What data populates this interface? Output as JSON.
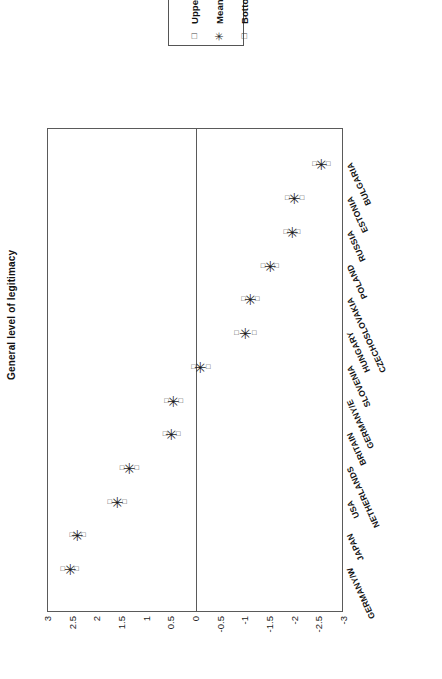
{
  "legend": {
    "title": "",
    "entries": [
      {
        "marker": "square-marker",
        "glyph": "□",
        "label": "Upper limit"
      },
      {
        "marker": "star-marker",
        "glyph": "✳",
        "label": "Mean"
      },
      {
        "marker": "square-marker",
        "glyph": "□",
        "label": "Bottom limit"
      }
    ]
  },
  "chart_data": {
    "type": "scatter",
    "title": "",
    "xlabel": "",
    "ylabel": "General level of legitimacy",
    "orientation": "horizontal",
    "grid": false,
    "legend_position": "top",
    "value_axis": {
      "label": "General level of legitimacy",
      "min": -3,
      "max": 3,
      "tick_step": 0.5,
      "ticks": [
        "3",
        "2.5",
        "2",
        "1.5",
        "1",
        "0.5",
        "0",
        "-0.5",
        "-1",
        "-1.5",
        "-2",
        "-2.5",
        "-3"
      ],
      "tick_values": [
        3,
        2.5,
        2,
        1.5,
        1,
        0.5,
        0,
        -0.5,
        -1,
        -1.5,
        -2,
        -2.5,
        -3
      ]
    },
    "categories": [
      "BULGARIA",
      "ESTONIA",
      "RUSSIA",
      "POLAND",
      "CZECHOSLOVAKIA",
      "HUNGARY",
      "SLOVENIA",
      "GERMANY/E",
      "BRITAIN",
      "NETHERLANDS",
      "USA",
      "JAPAN",
      "GERMANY/W"
    ],
    "series": [
      {
        "name": "Mean",
        "values": [
          -2.55,
          -2.0,
          -1.95,
          -1.5,
          -1.1,
          -1.0,
          -0.1,
          0.45,
          0.5,
          1.35,
          1.6,
          2.4,
          2.55
        ]
      },
      {
        "name": "Upper limit",
        "values": [
          -2.4,
          -1.85,
          -1.82,
          -1.36,
          -0.96,
          -0.82,
          0.05,
          0.6,
          0.63,
          1.5,
          1.75,
          2.52,
          2.7
        ]
      },
      {
        "name": "Bottom limit",
        "values": [
          -2.68,
          -2.15,
          -2.07,
          -1.63,
          -1.24,
          -1.18,
          -0.25,
          0.31,
          0.36,
          1.2,
          1.45,
          2.28,
          2.42
        ]
      }
    ],
    "points": [
      {
        "category": "BULGARIA",
        "mean": -2.55,
        "upper": -2.4,
        "lower": -2.68
      },
      {
        "category": "ESTONIA",
        "mean": -2.0,
        "upper": -1.85,
        "lower": -2.15
      },
      {
        "category": "RUSSIA",
        "mean": -1.95,
        "upper": -1.82,
        "lower": -2.07
      },
      {
        "category": "POLAND",
        "mean": -1.5,
        "upper": -1.36,
        "lower": -1.63
      },
      {
        "category": "CZECHOSLOVAKIA",
        "mean": -1.1,
        "upper": -0.96,
        "lower": -1.24
      },
      {
        "category": "HUNGARY",
        "mean": -1.0,
        "upper": -0.82,
        "lower": -1.18
      },
      {
        "category": "SLOVENIA",
        "mean": -0.1,
        "upper": 0.05,
        "lower": -0.25
      },
      {
        "category": "GERMANY/E",
        "mean": 0.45,
        "upper": 0.6,
        "lower": 0.31
      },
      {
        "category": "BRITAIN",
        "mean": 0.5,
        "upper": 0.63,
        "lower": 0.36
      },
      {
        "category": "NETHERLANDS",
        "mean": 1.35,
        "upper": 1.5,
        "lower": 1.2
      },
      {
        "category": "USA",
        "mean": 1.6,
        "upper": 1.75,
        "lower": 1.45
      },
      {
        "category": "JAPAN",
        "mean": 2.4,
        "upper": 2.52,
        "lower": 2.28
      },
      {
        "category": "GERMANY/W",
        "mean": 2.55,
        "upper": 2.7,
        "lower": 2.42
      }
    ],
    "colors": {
      "frame": "#5a5a5a",
      "marker": "#1d1d1d",
      "background": "#ffffff"
    }
  }
}
